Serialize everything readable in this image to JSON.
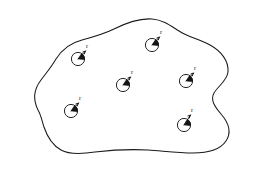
{
  "figure": {
    "kind": "geometric-diagram",
    "background_color": "#ffffff",
    "line_color": "#1a1a1a",
    "fill_color": "#ffffff",
    "canvas": {
      "width": 256,
      "height": 171
    }
  },
  "region": {
    "name": "irregular-closed-region",
    "stroke_color": "#1a1a1a",
    "stroke_width": 1.05,
    "fill_color": "#ffffff",
    "path": "M 38 110 C 33 100 34 89 41 80 C 47 72 52 66 56 59 C 61 51 70 43 82 40 C 93 37 104 34 114 29 C 126 23 139 18 152 19 C 164 20 171 26 179 31 C 188 37 199 39 210 45 C 221 51 229 61 228 72 C 227 81 218 86 214 93 C 210 100 215 107 221 114 C 228 122 232 132 226 141 C 220 150 206 153 193 153 C 178 153 163 151 148 150 C 130 149 112 150 95 152 C 82 154 70 155 61 150 C 52 145 47 136 44 127 C 42 121 41 115 38 110 Z"
  },
  "markers": {
    "count": 6,
    "label": "r",
    "circle_radius_px": 6.6,
    "description": "circle with drawn radius segment and filled wedge, labelled r",
    "items": [
      {
        "id": "circle-1",
        "cx": 78,
        "cy": 59,
        "label": "r",
        "label_x": 86,
        "label_y": 48,
        "tip_x": 85.5,
        "tip_y": 51
      },
      {
        "id": "circle-2",
        "cx": 152,
        "cy": 45,
        "label": "r",
        "label_x": 160,
        "label_y": 34,
        "tip_x": 159.5,
        "tip_y": 37
      },
      {
        "id": "circle-3",
        "cx": 123,
        "cy": 85,
        "label": "r",
        "label_x": 131,
        "label_y": 74,
        "tip_x": 130.5,
        "tip_y": 77
      },
      {
        "id": "circle-4",
        "cx": 186,
        "cy": 81,
        "label": "r",
        "label_x": 194,
        "label_y": 70,
        "tip_x": 193.5,
        "tip_y": 73
      },
      {
        "id": "circle-5",
        "cx": 71,
        "cy": 111,
        "label": "r",
        "label_x": 79,
        "label_y": 100,
        "tip_x": 78.5,
        "tip_y": 103
      },
      {
        "id": "circle-6",
        "cx": 184,
        "cy": 125,
        "label": "r",
        "label_x": 191,
        "label_y": 112,
        "tip_x": 190.5,
        "tip_y": 115
      }
    ]
  }
}
